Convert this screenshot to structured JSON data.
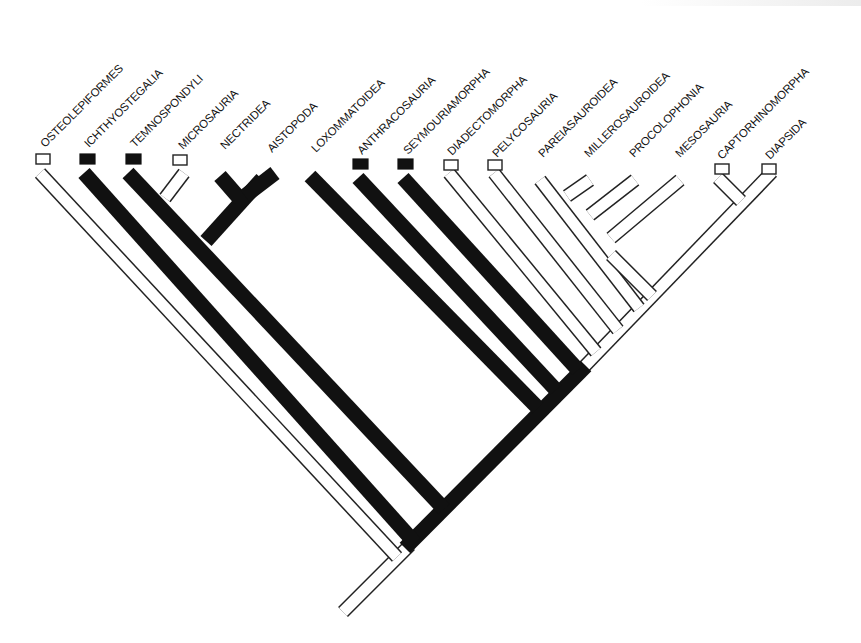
{
  "diagram": {
    "type": "cladogram",
    "title": "",
    "colors": {
      "derived_character": "#111111",
      "primitive_character": "#ffffff",
      "line": "#222222",
      "background": "#ffffff"
    },
    "legend": {
      "filled_box": "black (filled) terminal character state",
      "open_box": "white (open) terminal character state"
    },
    "taxa": [
      {
        "id": "osteolepiformes",
        "label": "OSTEOLEPIFORMES",
        "box": "open"
      },
      {
        "id": "ichthyostegalia",
        "label": "ICHTHYOSTEGALIA",
        "box": "filled"
      },
      {
        "id": "temnospondyli",
        "label": "TEMNOSPONDYLI",
        "box": "filled"
      },
      {
        "id": "microsauria",
        "label": "MICROSAURIA",
        "box": "open"
      },
      {
        "id": "nectridea",
        "label": "NECTRIDEA",
        "box": "none"
      },
      {
        "id": "aistopoda",
        "label": "AISTOPODA",
        "box": "none"
      },
      {
        "id": "loxommatoidea",
        "label": "LOXOMMATOIDEA",
        "box": "none"
      },
      {
        "id": "anthracosauria",
        "label": "ANTHRACOSAURIA",
        "box": "filled"
      },
      {
        "id": "seymouriamorpha",
        "label": "SEYMOURIAMORPHA",
        "box": "filled"
      },
      {
        "id": "diadectomorpha",
        "label": "DIADECTOMORPHA",
        "box": "open"
      },
      {
        "id": "pelycosauria",
        "label": "PELYCOSAURIA",
        "box": "open"
      },
      {
        "id": "pareiasauroidea",
        "label": "PAREIASAUROIDEA",
        "box": "none"
      },
      {
        "id": "millerosauroidea",
        "label": "MILLEROSAUROIDEA",
        "box": "none"
      },
      {
        "id": "procolophonia",
        "label": "PROCOLOPHONIA",
        "box": "none"
      },
      {
        "id": "mesosauria",
        "label": "MESOSAURIA",
        "box": "none"
      },
      {
        "id": "captorhinomorpha",
        "label": "CAPTORHINOMORPHA",
        "box": "open"
      },
      {
        "id": "diapsida",
        "label": "DIAPSIDA",
        "box": "open"
      }
    ]
  }
}
